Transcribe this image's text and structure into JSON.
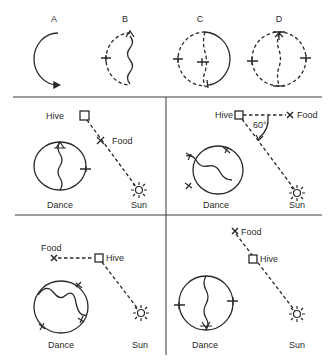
{
  "figure": {
    "top_row": {
      "panels": [
        {
          "id": "A",
          "label": "A",
          "description": "semicircular arc with arrow (round-dance start)"
        },
        {
          "id": "B",
          "label": "B",
          "description": "dashed half-circle plus wavy waggle run"
        },
        {
          "id": "C",
          "label": "C",
          "description": "dashed circle left, solid right return arc, dashed waggle run"
        },
        {
          "id": "D",
          "label": "D",
          "description": "full dashed figure-eight with wavy central run"
        }
      ]
    },
    "scenarios": [
      {
        "id": "food-toward-sun",
        "hive_label": "Hive",
        "food_label": "Food",
        "sun_label": "Sun",
        "dance_label": "Dance",
        "waggle_direction": "vertical up"
      },
      {
        "id": "food-60deg-left-of-sun",
        "hive_label": "Hive",
        "food_label": "Food",
        "sun_label": "Sun",
        "dance_label": "Dance",
        "angle_label": "60°",
        "waggle_direction": "tilted 60 degrees"
      },
      {
        "id": "food-left-of-hive",
        "hive_label": "Hive",
        "food_label": "Food",
        "sun_label": "Sun",
        "dance_label": "Dance",
        "waggle_direction": "tilted"
      },
      {
        "id": "food-away-from-sun",
        "hive_label": "Hive",
        "food_label": "Food",
        "sun_label": "Sun",
        "dance_label": "Dance",
        "waggle_direction": "vertical down"
      }
    ],
    "colors": {
      "ink": "#2a2a2a",
      "background": "#ffffff"
    }
  }
}
